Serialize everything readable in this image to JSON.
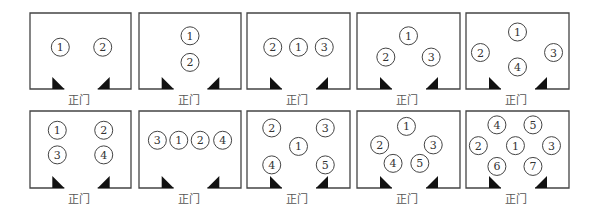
{
  "entrance_label": "正门",
  "colors": {
    "line": "#444444",
    "door": "#111111",
    "seat_stroke": "#444444",
    "text": "#333333"
  },
  "layouts": [
    {
      "id": "two-side-by-side",
      "seats": [
        {
          "n": "1",
          "x": 0.3,
          "y": 0.45
        },
        {
          "n": "2",
          "x": 0.72,
          "y": 0.45
        }
      ]
    },
    {
      "id": "two-stacked",
      "seats": [
        {
          "n": "1",
          "x": 0.5,
          "y": 0.3
        },
        {
          "n": "2",
          "x": 0.5,
          "y": 0.65
        }
      ]
    },
    {
      "id": "three-row",
      "seats": [
        {
          "n": "2",
          "x": 0.25,
          "y": 0.45
        },
        {
          "n": "1",
          "x": 0.5,
          "y": 0.45
        },
        {
          "n": "3",
          "x": 0.75,
          "y": 0.45
        }
      ]
    },
    {
      "id": "three-triangle",
      "seats": [
        {
          "n": "1",
          "x": 0.5,
          "y": 0.3
        },
        {
          "n": "2",
          "x": 0.28,
          "y": 0.58
        },
        {
          "n": "3",
          "x": 0.72,
          "y": 0.58
        }
      ]
    },
    {
      "id": "four-diamond",
      "seats": [
        {
          "n": "1",
          "x": 0.5,
          "y": 0.25
        },
        {
          "n": "2",
          "x": 0.14,
          "y": 0.52
        },
        {
          "n": "3",
          "x": 0.85,
          "y": 0.52
        },
        {
          "n": "4",
          "x": 0.5,
          "y": 0.71
        }
      ]
    },
    {
      "id": "four-grid",
      "seats": [
        {
          "n": "1",
          "x": 0.27,
          "y": 0.25
        },
        {
          "n": "2",
          "x": 0.73,
          "y": 0.25
        },
        {
          "n": "3",
          "x": 0.27,
          "y": 0.57
        },
        {
          "n": "4",
          "x": 0.73,
          "y": 0.57
        }
      ]
    },
    {
      "id": "four-row",
      "seats": [
        {
          "n": "3",
          "x": 0.18,
          "y": 0.38
        },
        {
          "n": "1",
          "x": 0.39,
          "y": 0.38
        },
        {
          "n": "2",
          "x": 0.6,
          "y": 0.38
        },
        {
          "n": "4",
          "x": 0.82,
          "y": 0.38
        }
      ]
    },
    {
      "id": "five-x",
      "seats": [
        {
          "n": "2",
          "x": 0.24,
          "y": 0.22
        },
        {
          "n": "3",
          "x": 0.76,
          "y": 0.22
        },
        {
          "n": "1",
          "x": 0.5,
          "y": 0.46
        },
        {
          "n": "4",
          "x": 0.24,
          "y": 0.7
        },
        {
          "n": "5",
          "x": 0.76,
          "y": 0.7
        }
      ]
    },
    {
      "id": "five-pentagon",
      "seats": [
        {
          "n": "1",
          "x": 0.48,
          "y": 0.2
        },
        {
          "n": "2",
          "x": 0.22,
          "y": 0.44
        },
        {
          "n": "3",
          "x": 0.74,
          "y": 0.44
        },
        {
          "n": "4",
          "x": 0.35,
          "y": 0.68
        },
        {
          "n": "5",
          "x": 0.61,
          "y": 0.68
        }
      ]
    },
    {
      "id": "seven-hex",
      "seats": [
        {
          "n": "4",
          "x": 0.3,
          "y": 0.18
        },
        {
          "n": "5",
          "x": 0.65,
          "y": 0.18
        },
        {
          "n": "2",
          "x": 0.12,
          "y": 0.45
        },
        {
          "n": "1",
          "x": 0.48,
          "y": 0.45
        },
        {
          "n": "3",
          "x": 0.83,
          "y": 0.45
        },
        {
          "n": "6",
          "x": 0.3,
          "y": 0.72
        },
        {
          "n": "7",
          "x": 0.65,
          "y": 0.72
        }
      ]
    }
  ]
}
